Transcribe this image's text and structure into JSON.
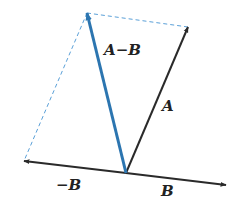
{
  "diagram": {
    "type": "vector-subtraction",
    "colors": {
      "vector": "#2a2a2a",
      "result_vector": "#2c75b0",
      "dashed_guide": "#5aa0d8",
      "background": "#ffffff"
    },
    "origin": [
      126,
      173
    ],
    "vectors": [
      {
        "id": "A",
        "label": "A",
        "tip": [
          188,
          27
        ],
        "color": "#2a2a2a"
      },
      {
        "id": "B",
        "label": "B",
        "tip": [
          226,
          185
        ],
        "color": "#2a2a2a"
      },
      {
        "id": "neg-B",
        "label": "−B",
        "tip": [
          24,
          161
        ],
        "color": "#2a2a2a"
      },
      {
        "id": "A-minus-B",
        "label": "A−B",
        "tip": [
          87,
          13
        ],
        "color": "#2c75b0"
      }
    ],
    "dashed_lines": [
      {
        "from": [
          87,
          13
        ],
        "to": [
          188,
          27
        ]
      },
      {
        "from": [
          87,
          13
        ],
        "to": [
          24,
          161
        ]
      }
    ],
    "labels": {
      "a_minus_b": "A−B",
      "a": "A",
      "neg_b": "−B",
      "b": "B"
    }
  }
}
